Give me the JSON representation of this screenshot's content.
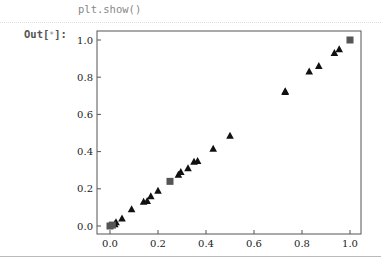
{
  "cell": {
    "code": "plt.show()",
    "output_prompt": "Out[",
    "output_prompt_star": "*",
    "output_prompt_end": "]:"
  },
  "chart_data": {
    "type": "scatter",
    "title": "",
    "xlabel": "",
    "ylabel": "",
    "xlim": [
      -0.05,
      1.05
    ],
    "ylim": [
      -0.05,
      1.05
    ],
    "grid": false,
    "legend": null,
    "x_ticks": [
      "0.0",
      "0.2",
      "0.4",
      "0.6",
      "0.8",
      "1.0"
    ],
    "y_ticks": [
      "0.0",
      "0.2",
      "0.4",
      "0.6",
      "0.8",
      "1.0"
    ],
    "series": [
      {
        "name": "triangles",
        "marker": "triangle",
        "color": "#111111",
        "points": [
          [
            0.02,
            0.01
          ],
          [
            0.025,
            0.02
          ],
          [
            0.05,
            0.04
          ],
          [
            0.09,
            0.09
          ],
          [
            0.14,
            0.13
          ],
          [
            0.155,
            0.135
          ],
          [
            0.17,
            0.16
          ],
          [
            0.2,
            0.19
          ],
          [
            0.285,
            0.275
          ],
          [
            0.295,
            0.29
          ],
          [
            0.325,
            0.31
          ],
          [
            0.35,
            0.345
          ],
          [
            0.365,
            0.35
          ],
          [
            0.43,
            0.415
          ],
          [
            0.5,
            0.485
          ],
          [
            0.73,
            0.72
          ],
          [
            0.73,
            0.725
          ],
          [
            0.83,
            0.83
          ],
          [
            0.87,
            0.86
          ],
          [
            0.935,
            0.93
          ],
          [
            0.955,
            0.95
          ]
        ]
      },
      {
        "name": "squares",
        "marker": "square",
        "color": "#555555",
        "points": [
          [
            0.0,
            0.0
          ],
          [
            0.01,
            0.005
          ],
          [
            0.25,
            0.24
          ],
          [
            1.0,
            1.0
          ]
        ]
      }
    ]
  }
}
